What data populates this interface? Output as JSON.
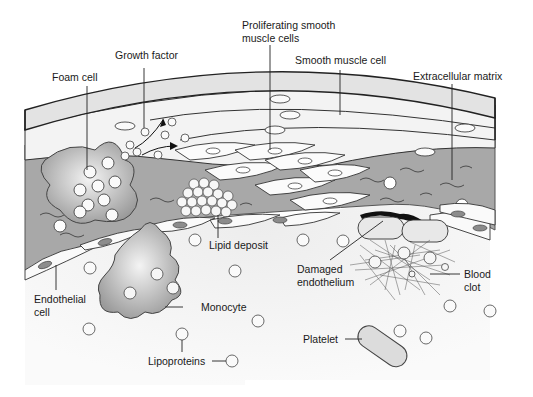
{
  "labels": {
    "foam_cell": "Foam cell",
    "growth_factor": "Growth factor",
    "proliferating_1": "Proliferating smooth",
    "proliferating_2": "muscle cells",
    "smooth_muscle_cell": "Smooth muscle cell",
    "extracellular_matrix": "Extracellular matrix",
    "lipid_deposit": "Lipid deposit",
    "endothelial_1": "Endothelial",
    "endothelial_2": "cell",
    "monocyte": "Monocyte",
    "lipoproteins": "Lipoproteins",
    "damaged_1": "Damaged",
    "damaged_2": "endothelium",
    "blood_clot_1": "Blood",
    "blood_clot_2": "clot",
    "platelet": "Platelet"
  },
  "colors": {
    "outer_layer": "#e6e6e6",
    "muscle_layer": "#f2f2f2",
    "matrix": "#a9a9a9",
    "lumen": "#f5f5f5",
    "nucleus": "#8c8c8c",
    "stroke": "#333333",
    "damage": "#111111"
  }
}
